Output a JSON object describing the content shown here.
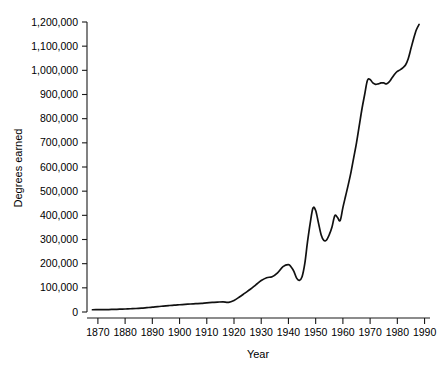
{
  "chart_data": {
    "type": "line",
    "title": "",
    "xlabel": "Year",
    "ylabel": "Degrees earned",
    "xlim": [
      1866,
      1992
    ],
    "ylim": [
      0,
      1200000
    ],
    "grid": false,
    "legend": "none",
    "x_ticks": [
      1870,
      1880,
      1890,
      1900,
      1910,
      1920,
      1930,
      1940,
      1950,
      1960,
      1970,
      1980,
      1990
    ],
    "x_tick_labels": [
      "1870",
      "1880",
      "1890",
      "1900",
      "1910",
      "1920",
      "1930",
      "1940",
      "1950",
      "1960",
      "1970",
      "1980",
      "1990"
    ],
    "y_ticks": [
      0,
      100000,
      200000,
      300000,
      400000,
      500000,
      600000,
      700000,
      800000,
      900000,
      1000000,
      1100000,
      1200000
    ],
    "y_tick_labels": [
      "0",
      "100,000",
      "200,000",
      "300,000",
      "400,000",
      "500,000",
      "600,000",
      "700,000",
      "800,000",
      "900,000",
      "1,000,000",
      "1,100,000",
      "1,200,000"
    ],
    "line_color": "#111111",
    "series": [
      {
        "name": "Degrees earned",
        "x": [
          1868,
          1870,
          1872,
          1874,
          1876,
          1878,
          1880,
          1882,
          1884,
          1886,
          1888,
          1890,
          1892,
          1894,
          1896,
          1898,
          1900,
          1902,
          1904,
          1906,
          1908,
          1910,
          1912,
          1914,
          1916,
          1918,
          1920,
          1922,
          1924,
          1926,
          1928,
          1930,
          1932,
          1934,
          1936,
          1938,
          1940,
          1941,
          1942,
          1943,
          1944,
          1945,
          1946,
          1947,
          1948,
          1949,
          1950,
          1951,
          1952,
          1953,
          1954,
          1955,
          1956,
          1957,
          1958,
          1959,
          1960,
          1961,
          1962,
          1963,
          1964,
          1965,
          1966,
          1967,
          1968,
          1969,
          1970,
          1971,
          1972,
          1973,
          1974,
          1975,
          1976,
          1977,
          1978,
          1979,
          1980,
          1981,
          1982,
          1983,
          1984,
          1985,
          1986,
          1987,
          1988
        ],
        "y": [
          9400,
          9500,
          9800,
          10200,
          10800,
          11500,
          12500,
          13500,
          14500,
          16000,
          18000,
          20000,
          22500,
          24500,
          26500,
          28500,
          30000,
          31500,
          33000,
          34500,
          36000,
          38000,
          39500,
          41000,
          42000,
          40000,
          48000,
          62000,
          78000,
          94000,
          112000,
          130000,
          142000,
          146000,
          162000,
          188000,
          196000,
          186000,
          168000,
          140000,
          131000,
          146000,
          200000,
          290000,
          368000,
          430000,
          420000,
          370000,
          320000,
          296000,
          298000,
          320000,
          352000,
          398000,
          392000,
          378000,
          432000,
          480000,
          528000,
          580000,
          640000,
          700000,
          770000,
          840000,
          900000,
          958000,
          962000,
          948000,
          942000,
          944000,
          948000,
          948000,
          944000,
          952000,
          968000,
          984000,
          996000,
          1002000,
          1010000,
          1022000,
          1048000,
          1090000,
          1132000,
          1168000,
          1190000
        ]
      }
    ],
    "annotations": []
  }
}
